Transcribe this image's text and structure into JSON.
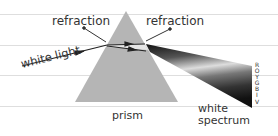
{
  "diagram": {
    "labels": {
      "refraction_left": "refraction",
      "refraction_right": "refraction",
      "white_light": "white light",
      "prism": "prism",
      "white_spectrum_line1": "white",
      "white_spectrum_line2": "spectrum"
    },
    "spectrum_letters": [
      "R",
      "O",
      "Y",
      "G",
      "B",
      "I",
      "V"
    ],
    "colors": {
      "prism_fill": "#b8b8b8",
      "rule_line": "#dcdcdc",
      "text": "#333333",
      "spectrum_dark": "#222222",
      "spectrum_light": "#d8d8d8"
    }
  }
}
